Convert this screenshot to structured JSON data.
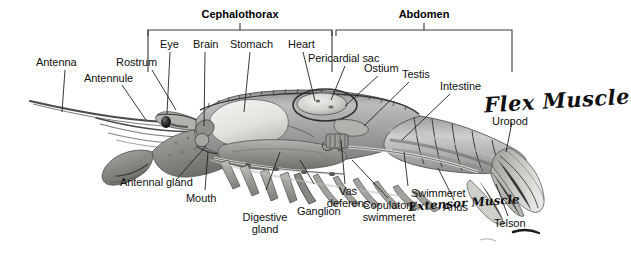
{
  "diagram": {
    "brackets": [
      {
        "name": "cephalothorax",
        "label": "Cephalothorax"
      },
      {
        "name": "abdomen",
        "label": "Abdomen"
      }
    ],
    "labels": [
      {
        "name": "antenna",
        "text": "Antenna"
      },
      {
        "name": "antennule",
        "text": "Antennule"
      },
      {
        "name": "rostrum",
        "text": "Rostrum"
      },
      {
        "name": "eye",
        "text": "Eye"
      },
      {
        "name": "brain",
        "text": "Brain"
      },
      {
        "name": "stomach",
        "text": "Stomach"
      },
      {
        "name": "heart",
        "text": "Heart"
      },
      {
        "name": "pericardial-sac",
        "text": "Pericardial sac"
      },
      {
        "name": "ostium",
        "text": "Ostium"
      },
      {
        "name": "testis",
        "text": "Testis"
      },
      {
        "name": "intestine",
        "text": "Intestine"
      },
      {
        "name": "uropod",
        "text": "Uropod"
      },
      {
        "name": "telson",
        "text": "Telson"
      },
      {
        "name": "anus",
        "text": "Anus"
      },
      {
        "name": "swimmeret",
        "text": "Swimmeret"
      },
      {
        "name": "copulatory-swimmeret",
        "text": "Copulatory\nswimmeret"
      },
      {
        "name": "vas-deferens",
        "text": "Vas\ndeferens"
      },
      {
        "name": "ganglion",
        "text": "Ganglion"
      },
      {
        "name": "digestive-gland",
        "text": "Digestive\ngland"
      },
      {
        "name": "mouth",
        "text": "Mouth"
      },
      {
        "name": "antennal-gland",
        "text": "Antennal gland"
      }
    ],
    "annotations": [
      {
        "name": "flex-muscle",
        "text": "Flex Muscle"
      },
      {
        "name": "extensor-muscle",
        "text": "Extensor Muscle"
      }
    ],
    "colors": {
      "ink": "#111111",
      "leader": "#222222",
      "bracket": "#3a3a3a",
      "background": "#ffffff"
    }
  }
}
